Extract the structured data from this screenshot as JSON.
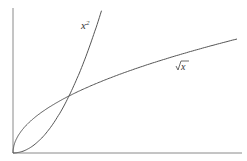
{
  "chart_data": {
    "type": "line",
    "title": "",
    "xlabel": "",
    "ylabel": "",
    "xlim": [
      0,
      4
    ],
    "ylim": [
      0,
      2.55
    ],
    "grid": false,
    "legend": "none (inline curve labels)",
    "series": [
      {
        "name": "x^2",
        "label": "x²",
        "x": [
          0,
          0.25,
          0.5,
          0.75,
          1,
          1.25,
          1.5,
          1.58
        ],
        "y": [
          0,
          0.0625,
          0.25,
          0.5625,
          1,
          1.5625,
          2.25,
          2.5
        ]
      },
      {
        "name": "sqrt(x)",
        "label": "√x",
        "x": [
          0,
          0.25,
          0.5,
          1,
          1.5,
          2,
          2.5,
          3,
          3.5,
          4
        ],
        "y": [
          0,
          0.5,
          0.707,
          1,
          1.225,
          1.414,
          1.581,
          1.732,
          1.871,
          2
        ]
      }
    ],
    "annotations": [
      {
        "text": "x²",
        "near": "upper part of x² curve"
      },
      {
        "text": "√x",
        "near": "right part of √x curve"
      },
      {
        "text": "intersection",
        "point": [
          1,
          1
        ]
      }
    ]
  },
  "labels": {
    "square": "x",
    "square_exp": "2",
    "sqrt": "x"
  },
  "colors": {
    "line": "#555555",
    "axis": "#888888"
  }
}
